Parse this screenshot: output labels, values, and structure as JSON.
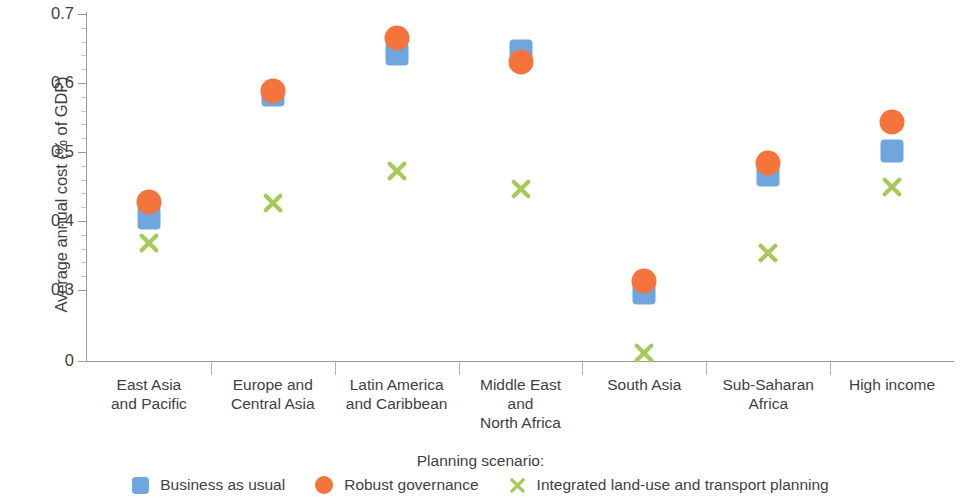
{
  "chart_data": {
    "type": "scatter",
    "title": "",
    "xlabel": "Planning scenario:",
    "ylabel": "Average annual cost (% of GDP)",
    "ylim": [
      0,
      0.7
    ],
    "y_broken_axis": true,
    "ytick_labels": [
      "0.7",
      "0.6",
      "0.5",
      "0.4",
      "0.3",
      "0"
    ],
    "ytick_values": [
      0.7,
      0.6,
      0.5,
      0.4,
      0.3,
      0
    ],
    "grid": false,
    "legend_position": "bottom",
    "categories": [
      "East Asia\nand Pacific",
      "Europe and\nCentral Asia",
      "Latin America\nand Caribbean",
      "Middle East\nand\nNorth Africa",
      "South Asia",
      "Sub-Saharan\nAfrica",
      "High income"
    ],
    "series": [
      {
        "name": "Business as usual",
        "marker": "square",
        "color": "#6ea6dd",
        "values": [
          0.405,
          0.583,
          0.642,
          0.646,
          0.287,
          0.466,
          0.502
        ]
      },
      {
        "name": "Robust governance",
        "marker": "circle",
        "color": "#f4743b",
        "values": [
          0.428,
          0.589,
          0.665,
          0.63,
          0.313,
          0.484,
          0.543
        ]
      },
      {
        "name": "Integrated land-use and transport planning",
        "marker": "x",
        "color": "#a7c957",
        "values": [
          0.368,
          0.426,
          0.472,
          0.446,
          0.033,
          0.354,
          0.449
        ]
      }
    ]
  },
  "axis": {
    "y_title": "Average annual cost (% of GDP)",
    "ticks": [
      {
        "label": "0.7",
        "value": 0.7
      },
      {
        "label": "0.6",
        "value": 0.6
      },
      {
        "label": "0.5",
        "value": 0.5
      },
      {
        "label": "0.4",
        "value": 0.4
      },
      {
        "label": "0.3",
        "value": 0.3
      },
      {
        "label": "0",
        "value": 0
      }
    ]
  },
  "categories": [
    {
      "lines": [
        "East Asia",
        "and Pacific"
      ]
    },
    {
      "lines": [
        "Europe and",
        "Central Asia"
      ]
    },
    {
      "lines": [
        "Latin America",
        "and Caribbean"
      ]
    },
    {
      "lines": [
        "Middle East",
        "and",
        "North Africa"
      ]
    },
    {
      "lines": [
        "South Asia"
      ]
    },
    {
      "lines": [
        "Sub-Saharan",
        "Africa"
      ]
    },
    {
      "lines": [
        "High income"
      ]
    }
  ],
  "legend": {
    "title": "Planning scenario:",
    "items": [
      {
        "label": "Business as usual",
        "marker": "square",
        "color": "#6ea6dd"
      },
      {
        "label": "Robust governance",
        "marker": "circle",
        "color": "#f4743b"
      },
      {
        "label": "Integrated land-use and transport planning",
        "marker": "x",
        "color": "#a7c957"
      }
    ]
  },
  "colors": {
    "blue": "#6ea6dd",
    "orange": "#f4743b",
    "green": "#a7c957",
    "axis": "#9a9a9a",
    "text": "#3f3f3f"
  }
}
